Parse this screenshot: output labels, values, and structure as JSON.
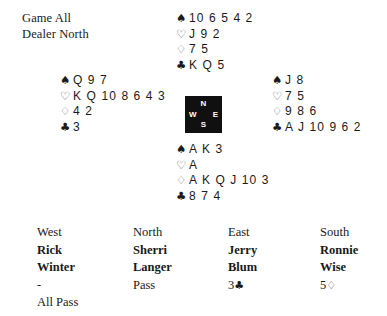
{
  "board": {
    "vulnerability": "Game All",
    "dealer": "Dealer North"
  },
  "suit_symbols": {
    "spade": "♠",
    "heart": "♡",
    "diamond": "♢",
    "club": "♣"
  },
  "hands": {
    "north": {
      "seat": "North",
      "spades": "10 6 5 4 2",
      "hearts": "J 9 2",
      "diamonds": "7 5",
      "clubs": "K Q 5"
    },
    "west": {
      "seat": "West",
      "spades": "Q 9 7",
      "hearts": "K Q 10 8 6 4 3",
      "diamonds": "4 2",
      "clubs": "3"
    },
    "east": {
      "seat": "East",
      "spades": "J 8",
      "hearts": "7 5",
      "diamonds": "9 8 6",
      "clubs": "A J 10 9 6 2"
    },
    "south": {
      "seat": "South",
      "spades": "A K 3",
      "hearts": "A",
      "diamonds": "A K Q J 10 3",
      "clubs": "8 7 4"
    }
  },
  "compass": {
    "north": "N",
    "south": "S",
    "east": "E",
    "west": "W"
  },
  "auction": {
    "columns": [
      {
        "seat": "West",
        "name_line1": "Rick",
        "name_line2": "Winter",
        "bid1_text": "-",
        "bid1_suit": "",
        "bid2": "All Pass"
      },
      {
        "seat": "North",
        "name_line1": "Sherri",
        "name_line2": "Langer",
        "bid1_text": "Pass",
        "bid1_suit": "",
        "bid2": ""
      },
      {
        "seat": "East",
        "name_line1": "Jerry",
        "name_line2": "Blum",
        "bid1_text": "3",
        "bid1_suit": "♣",
        "bid2": ""
      },
      {
        "seat": "South",
        "name_line1": "Ronnie",
        "name_line2": "Wise",
        "bid1_text": "5",
        "bid1_suit": "♢",
        "bid2": ""
      }
    ]
  },
  "colors": {
    "text": "#1a1a1a",
    "compass_bg": "#101010",
    "compass_text": "#ffffff"
  }
}
